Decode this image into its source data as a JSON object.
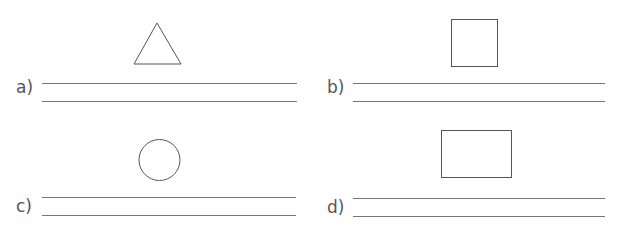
{
  "worksheet": {
    "items": [
      {
        "label": "a)",
        "shape": "triangle"
      },
      {
        "label": "b)",
        "shape": "square"
      },
      {
        "label": "c)",
        "shape": "circle"
      },
      {
        "label": "d)",
        "shape": "rectangle"
      }
    ],
    "colors": {
      "stroke": "#555555",
      "line": "#777777",
      "text": "#555555"
    }
  }
}
